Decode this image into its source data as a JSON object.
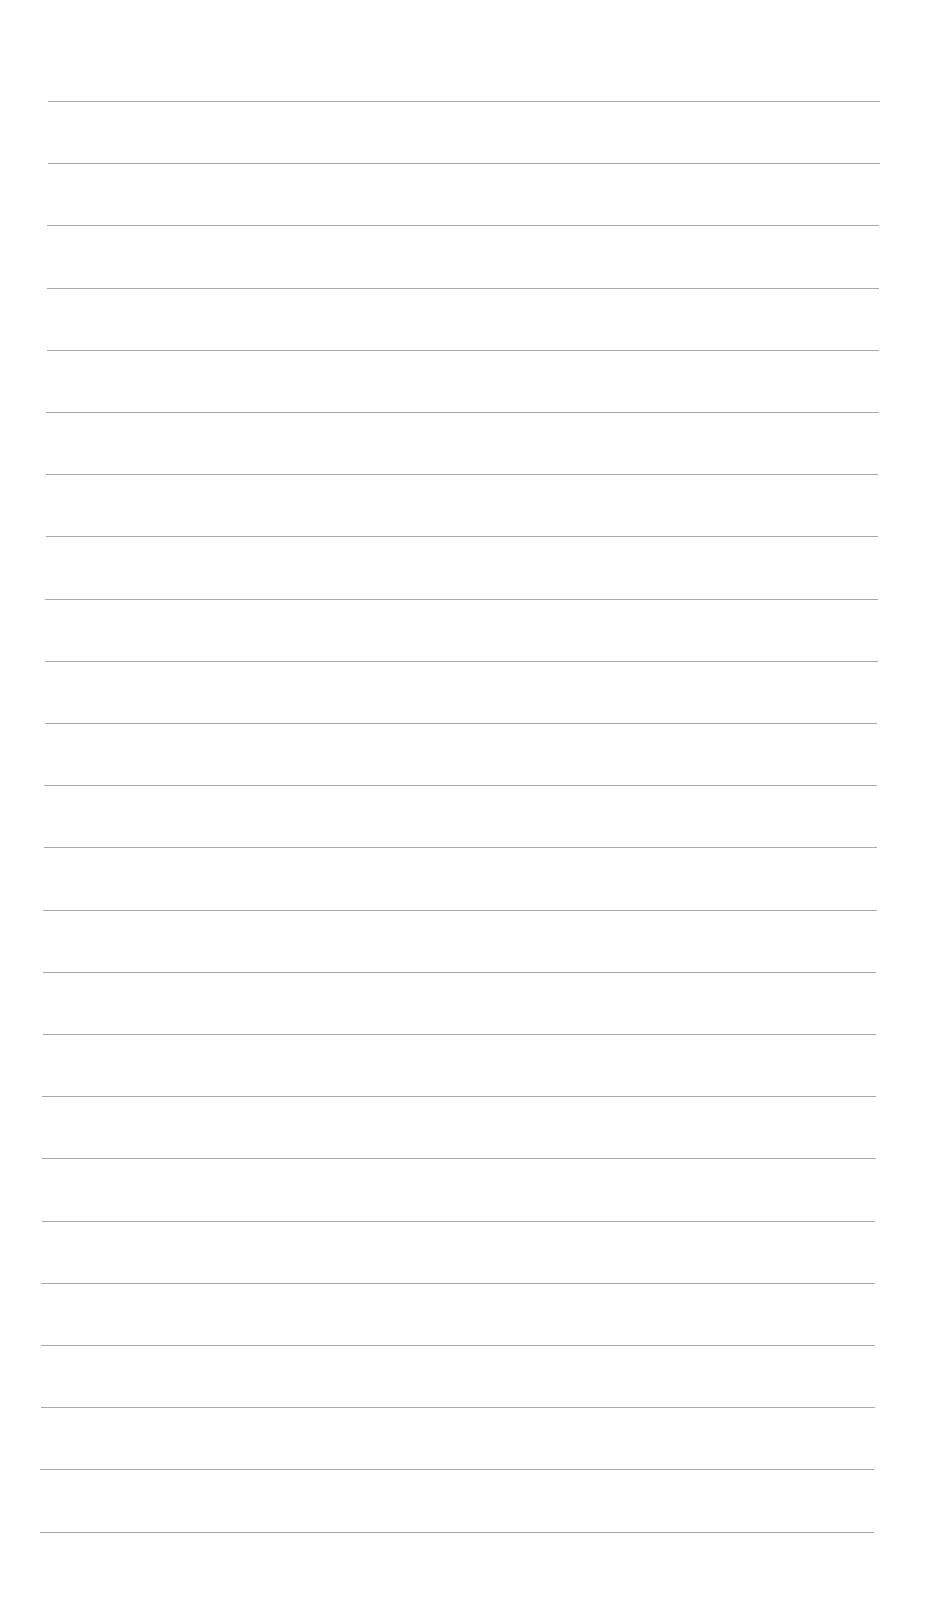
{
  "page": {
    "type": "lined-paper",
    "background": "#ffffff",
    "line_color": "#9a9a9a",
    "line_count": 24,
    "first_line_y": 101,
    "line_spacing": 62.2,
    "line_left_start": 48,
    "line_left_end": 40,
    "line_right_start": 880,
    "line_right_end": 874
  }
}
